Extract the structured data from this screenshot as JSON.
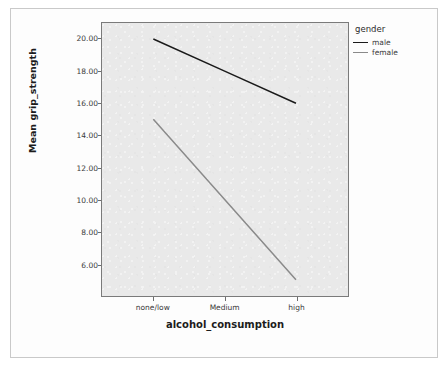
{
  "chart_data": {
    "type": "line",
    "title": "",
    "xlabel": "alcohol_consumption",
    "ylabel": "Mean grip_strength",
    "categories": [
      "none/low",
      "Medium",
      "high"
    ],
    "series": [
      {
        "name": "male",
        "color": "#1a1a1a",
        "values": [
          20.0,
          18.0,
          16.0
        ]
      },
      {
        "name": "female",
        "color": "#8a8a8a",
        "values": [
          15.0,
          10.0,
          5.0
        ]
      }
    ],
    "ylim": [
      4.0,
      21.0
    ],
    "yticks": [
      20.0,
      18.0,
      16.0,
      14.0,
      12.0,
      10.0,
      8.0,
      6.0
    ],
    "ytick_labels": [
      "20.00",
      "18.00",
      "16.00",
      "14.00",
      "12.00",
      "10.00",
      "8.00",
      "6.00"
    ],
    "grid": false,
    "legend_title": "gender",
    "legend_position": "right",
    "plot_background": "#e9e9e9"
  }
}
